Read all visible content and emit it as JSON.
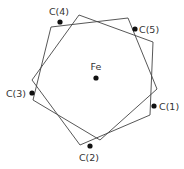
{
  "diagram": {
    "type": "ferrocene-top-view",
    "center_atom": {
      "label": "Fe",
      "x": 96,
      "y": 78,
      "label_x": 96,
      "label_y": 70
    },
    "carbon_atoms": [
      {
        "label": "C(1)",
        "x": 154,
        "y": 106,
        "label_x": 159,
        "label_y": 109.5,
        "anchor": "start"
      },
      {
        "label": "C(2)",
        "x": 90,
        "y": 146,
        "label_x": 89,
        "label_y": 161,
        "anchor": "middle"
      },
      {
        "label": "C(3)",
        "x": 32,
        "y": 93,
        "label_x": 26,
        "label_y": 96.5,
        "anchor": "end"
      },
      {
        "label": "C(4)",
        "x": 60,
        "y": 22,
        "label_x": 59,
        "label_y": 15,
        "anchor": "middle"
      },
      {
        "label": "C(5)",
        "x": 135,
        "y": 29,
        "label_x": 139,
        "label_y": 32.5,
        "anchor": "start"
      }
    ],
    "rings": [
      {
        "name": "ring-1",
        "points": "51,27 128,18 157,89 100,140 33,100"
      },
      {
        "name": "ring-2",
        "points": "79,15 153,42 150,115 80,145 32,80"
      }
    ],
    "colors": {
      "line": "#444444",
      "atom": "#111111",
      "text": "#333333"
    }
  }
}
